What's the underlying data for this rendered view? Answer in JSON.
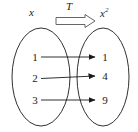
{
  "figure": {
    "title_left": "x",
    "title_right_base": "x",
    "title_right_exponent": "2",
    "transform_label": "T"
  },
  "diagram_data": {
    "type": "mapping-diagram",
    "rule": "x → x²",
    "domain_label": "x",
    "codomain_label": "x²",
    "transform_label": "T",
    "domain_values": [
      "1",
      "2",
      "3"
    ],
    "codomain_values": [
      "1",
      "4",
      "9"
    ],
    "mappings": [
      {
        "from": "1",
        "to": "1"
      },
      {
        "from": "2",
        "to": "4"
      },
      {
        "from": "3",
        "to": "9"
      }
    ],
    "stroke_color": "#1a1a1a",
    "background_color": "#ffffff"
  },
  "domain": {
    "items": [
      {
        "value": "1"
      },
      {
        "value": "2"
      },
      {
        "value": "3"
      }
    ]
  },
  "codomain": {
    "items": [
      {
        "value": "1"
      },
      {
        "value": "4"
      },
      {
        "value": "9"
      }
    ]
  }
}
